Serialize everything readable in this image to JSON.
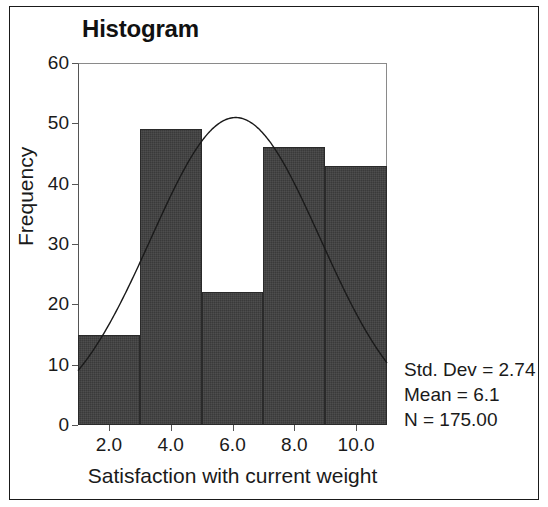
{
  "chart_data": {
    "type": "bar",
    "title": "Histogram",
    "xlabel": "Satisfaction with current weight",
    "ylabel": "Frequency",
    "xlim": [
      1,
      11
    ],
    "ylim": [
      0,
      60
    ],
    "grid": false,
    "legend": null,
    "bin_width": 2,
    "bin_edges": [
      1,
      3,
      5,
      7,
      9,
      11
    ],
    "bin_centers": [
      2,
      4,
      6,
      8,
      10
    ],
    "categories": [
      "1-3",
      "3-5",
      "5-7",
      "7-9",
      "9-11"
    ],
    "values": [
      15,
      49,
      22,
      46,
      43
    ],
    "xticks": [
      2,
      4,
      6,
      8,
      10
    ],
    "xtick_labels": [
      "2.0",
      "4.0",
      "6.0",
      "8.0",
      "10.0"
    ],
    "yticks": [
      0,
      10,
      20,
      30,
      40,
      50,
      60
    ],
    "ytick_labels": [
      "0",
      "10",
      "20",
      "30",
      "40",
      "50",
      "60"
    ],
    "overlay": {
      "type": "normal-curve",
      "mean": 6.1,
      "std_dev": 2.74,
      "n": 175,
      "peak_value": 52.4
    },
    "annotations": {
      "std_dev": "Std. Dev = 2.74",
      "mean": "Mean = 6.1",
      "n": "N = 175.00"
    },
    "colors": {
      "bar_fill": "#3a3a3a",
      "bar_edge": "#2a2a2a",
      "axis": "#555555",
      "text": "#1a1a1a",
      "background": "#ffffff",
      "border": "#1a1a1a"
    }
  }
}
